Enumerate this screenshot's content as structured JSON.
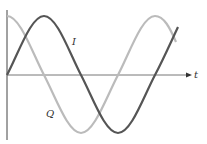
{
  "diagram": {
    "title": "",
    "axes": {
      "horizontal_label": "t",
      "vertical_label": ""
    },
    "curves": [
      {
        "name": "I",
        "label": "I",
        "shape": "sine",
        "color": "#555555"
      },
      {
        "name": "Q",
        "label": "Q",
        "shape": "cosine",
        "color": "#bbbbbb"
      }
    ]
  }
}
